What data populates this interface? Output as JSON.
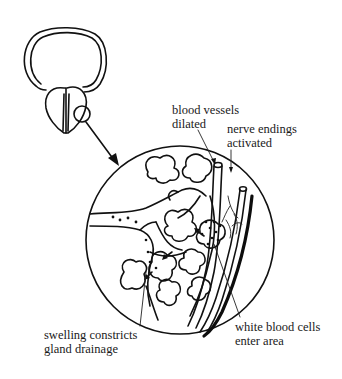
{
  "diagram": {
    "type": "anatomical-illustration",
    "overview": {
      "description": "prostate gland below bladder outline with magnified region circled",
      "magnifier_target": "small circle on right lobe"
    },
    "detail_view": {
      "description": "magnified cross-section of glandular tissue"
    },
    "labels": {
      "blood_vessels": {
        "line1": "blood vessels",
        "line2": "dilated"
      },
      "nerve_endings": {
        "line1": "nerve endings",
        "line2": "activated"
      },
      "swelling": {
        "line1": "swelling constricts",
        "line2": "gland drainage"
      },
      "white_blood_cells": {
        "line1": "white blood cells",
        "line2": "enter area"
      }
    },
    "colors": {
      "ink": "#111111",
      "background": "#ffffff"
    }
  }
}
